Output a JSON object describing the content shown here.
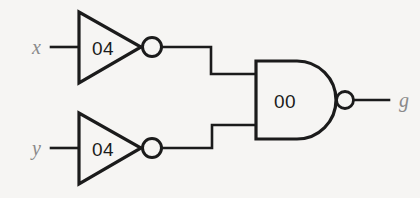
{
  "diagram": {
    "type": "logic-circuit-schematic",
    "background_color": "#f6f5f3",
    "ink_color": "#1b1b1b",
    "label_color": "#8a8a8a",
    "inputs": [
      {
        "id": "x",
        "label": "x"
      },
      {
        "id": "y",
        "label": "y"
      }
    ],
    "outputs": [
      {
        "id": "g",
        "label": "g"
      }
    ],
    "gates": [
      {
        "id": "inverter-top",
        "kind": "NOT",
        "label": "04",
        "inputs": [
          "x"
        ],
        "output": "not-x"
      },
      {
        "id": "inverter-bottom",
        "kind": "NOT",
        "label": "04",
        "inputs": [
          "y"
        ],
        "output": "not-y"
      },
      {
        "id": "nand-gate",
        "kind": "NAND",
        "label": "00",
        "inputs": [
          "not-x",
          "not-y"
        ],
        "output": "g"
      }
    ],
    "nets": [
      {
        "id": "net-x-in",
        "from": "x",
        "to": "inverter-top"
      },
      {
        "id": "net-y-in",
        "from": "y",
        "to": "inverter-bottom"
      },
      {
        "id": "net-notx",
        "from": "inverter-top",
        "to": "nand-gate"
      },
      {
        "id": "net-noty",
        "from": "inverter-bottom",
        "to": "nand-gate"
      },
      {
        "id": "net-g-out",
        "from": "nand-gate",
        "to": "g"
      }
    ]
  }
}
